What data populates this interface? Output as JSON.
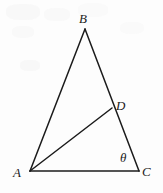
{
  "figure": {
    "kind": "geometry-diagram",
    "background_color": "#fdfdfd",
    "stroke_color": "#1b1b1b",
    "stroke_width": 1.5,
    "canvas": {
      "width": 163,
      "height": 193
    },
    "points": {
      "A": {
        "label": "A",
        "x": 30,
        "y": 171
      },
      "B": {
        "label": "B",
        "x": 85,
        "y": 29
      },
      "C": {
        "label": "C",
        "x": 139,
        "y": 171
      },
      "D": {
        "label": "D",
        "x": 112,
        "y": 108
      }
    },
    "segments": [
      {
        "name": "side-AB",
        "from": "A",
        "to": "B"
      },
      {
        "name": "side-BC",
        "from": "B",
        "to": "C"
      },
      {
        "name": "side-AC",
        "from": "A",
        "to": "C"
      },
      {
        "name": "cevian-AD",
        "from": "A",
        "to": "D"
      }
    ],
    "angles": [
      {
        "name": "angle-at-C",
        "symbol": "θ",
        "at_vertex": "C"
      }
    ],
    "labels": {
      "B": "B",
      "D": "D",
      "A": "A",
      "C": "C",
      "theta": "θ"
    }
  }
}
